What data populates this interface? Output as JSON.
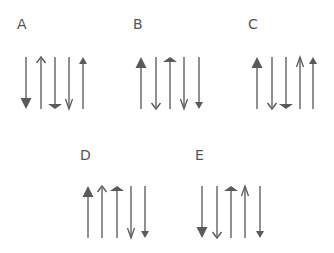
{
  "colors": {
    "line": "#6b6b6b",
    "head": "#5a5a5a",
    "label": "#555555"
  },
  "groups": [
    {
      "label": "A",
      "label_x": 17,
      "label_y": 17,
      "top": 57,
      "bottom": 109,
      "arrows": [
        {
          "x": 26,
          "dir": "down",
          "head": "big-filled"
        },
        {
          "x": 41,
          "dir": "up",
          "head": "open"
        },
        {
          "x": 55,
          "dir": "down",
          "head": "flat-filled"
        },
        {
          "x": 69,
          "dir": "down",
          "head": "barbed"
        },
        {
          "x": 83,
          "dir": "up",
          "head": "small-filled"
        }
      ]
    },
    {
      "label": "B",
      "label_x": 133,
      "label_y": 17,
      "top": 57,
      "bottom": 109,
      "arrows": [
        {
          "x": 141,
          "dir": "up",
          "head": "big-filled"
        },
        {
          "x": 156,
          "dir": "down",
          "head": "open"
        },
        {
          "x": 170,
          "dir": "up",
          "head": "flat-filled"
        },
        {
          "x": 184,
          "dir": "down",
          "head": "barbed"
        },
        {
          "x": 199,
          "dir": "down",
          "head": "small-filled"
        }
      ]
    },
    {
      "label": "C",
      "label_x": 248,
      "label_y": 17,
      "top": 57,
      "bottom": 109,
      "arrows": [
        {
          "x": 257,
          "dir": "up",
          "head": "big-filled"
        },
        {
          "x": 272,
          "dir": "down",
          "head": "open"
        },
        {
          "x": 286,
          "dir": "down",
          "head": "flat-filled"
        },
        {
          "x": 300,
          "dir": "up",
          "head": "barbed"
        },
        {
          "x": 313,
          "dir": "up",
          "head": "small-filled"
        }
      ]
    },
    {
      "label": "D",
      "label_x": 80,
      "label_y": 148,
      "top": 186,
      "bottom": 238,
      "arrows": [
        {
          "x": 88,
          "dir": "up",
          "head": "big-filled"
        },
        {
          "x": 102,
          "dir": "up",
          "head": "open"
        },
        {
          "x": 117,
          "dir": "up",
          "head": "flat-filled"
        },
        {
          "x": 131,
          "dir": "down",
          "head": "barbed"
        },
        {
          "x": 145,
          "dir": "down",
          "head": "small-filled"
        }
      ]
    },
    {
      "label": "E",
      "label_x": 195,
      "label_y": 148,
      "top": 186,
      "bottom": 238,
      "arrows": [
        {
          "x": 202,
          "dir": "down",
          "head": "big-filled"
        },
        {
          "x": 217,
          "dir": "down",
          "head": "open"
        },
        {
          "x": 231,
          "dir": "up",
          "head": "flat-filled"
        },
        {
          "x": 245,
          "dir": "up",
          "head": "barbed"
        },
        {
          "x": 260,
          "dir": "down",
          "head": "small-filled"
        }
      ]
    }
  ]
}
